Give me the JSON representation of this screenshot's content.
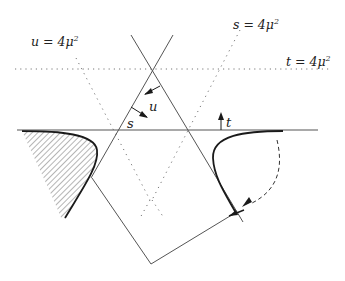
{
  "diagram": {
    "type": "Mandelstam plane / dispersion contour diagram",
    "colors": {
      "line": "#555555",
      "curve": "#1a1a1a",
      "dotted": "#777777",
      "hatch": "#777777",
      "background": "#ffffff"
    },
    "labels": {
      "u_threshold": {
        "var": "u",
        "eq": " = 4",
        "mu": "μ",
        "exp": "2"
      },
      "s_threshold": {
        "var": "s",
        "eq": " = 4",
        "mu": "μ",
        "exp": "2"
      },
      "t_threshold": {
        "var": "t",
        "eq": " = 4",
        "mu": "μ",
        "exp": "2"
      },
      "u_axis": "u",
      "s_axis": "s",
      "t_axis": "t"
    },
    "elements": {
      "t_zero_line": "horizontal solid line",
      "t_threshold_line": "horizontal dotted line",
      "s_threshold_line": "diagonal dotted line",
      "u_threshold_line": "diagonal dotted line",
      "left_cut_region": "hatched region with bold boundary",
      "right_curve": "bold curve",
      "dashed_arc": "dashed arc with arrowhead",
      "contour_polygon": "solid polygon path"
    }
  }
}
